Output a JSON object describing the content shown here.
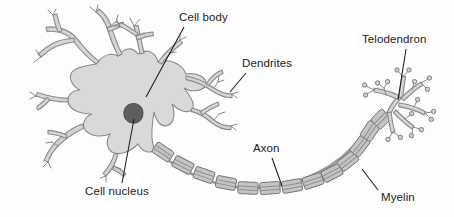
{
  "diagram": {
    "background_color": "#fdfdfd",
    "labels": [
      {
        "id": "cell_body",
        "text": "Cell body"
      },
      {
        "id": "dendrites",
        "text": "Dendrites"
      },
      {
        "id": "telodendron",
        "text": "Telodendron"
      },
      {
        "id": "axon",
        "text": "Axon"
      },
      {
        "id": "cell_nucleus",
        "text": "Cell nucleus"
      },
      {
        "id": "myelin",
        "text": "Myelin"
      }
    ],
    "parts": {
      "soma": {
        "name": "Cell body (soma)",
        "fill": "#d9d9d9",
        "stroke": "#8a8a8a"
      },
      "nucleus": {
        "name": "Cell nucleus",
        "fill": "#5e5e5e",
        "stroke": "#3c3c3c"
      },
      "dendrites": {
        "name": "Dendrites",
        "fill": "#d4d4d4",
        "stroke": "#8a8a8a"
      },
      "axon": {
        "name": "Axon",
        "fill": "#cfcfcf",
        "stroke": "#7a7a7a"
      },
      "myelin": {
        "name": "Myelin sheath segments",
        "fill": "#c4c4c4",
        "stroke": "#6f6f6f",
        "segment_count": 17
      },
      "telodendron": {
        "name": "Telodendron / axon terminals",
        "fill": "#d4d4d4",
        "stroke": "#8a8a8a"
      }
    },
    "leader_lines": [
      {
        "for": "cell_body",
        "from": [
          184,
          27
        ],
        "to": [
          146,
          97
        ]
      },
      {
        "for": "dendrites",
        "from": [
          246,
          73
        ],
        "to": [
          230,
          92
        ]
      },
      {
        "for": "telodendron",
        "from": [
          406,
          49
        ],
        "to": [
          398,
          100
        ]
      },
      {
        "for": "axon",
        "from": [
          272,
          158
        ],
        "to": [
          282,
          186
        ]
      },
      {
        "for": "cell_nucleus",
        "from": [
          122,
          183
        ],
        "to": [
          134,
          119
        ]
      },
      {
        "for": "myelin",
        "from": [
          378,
          190
        ],
        "to": [
          362,
          169
        ]
      }
    ]
  }
}
